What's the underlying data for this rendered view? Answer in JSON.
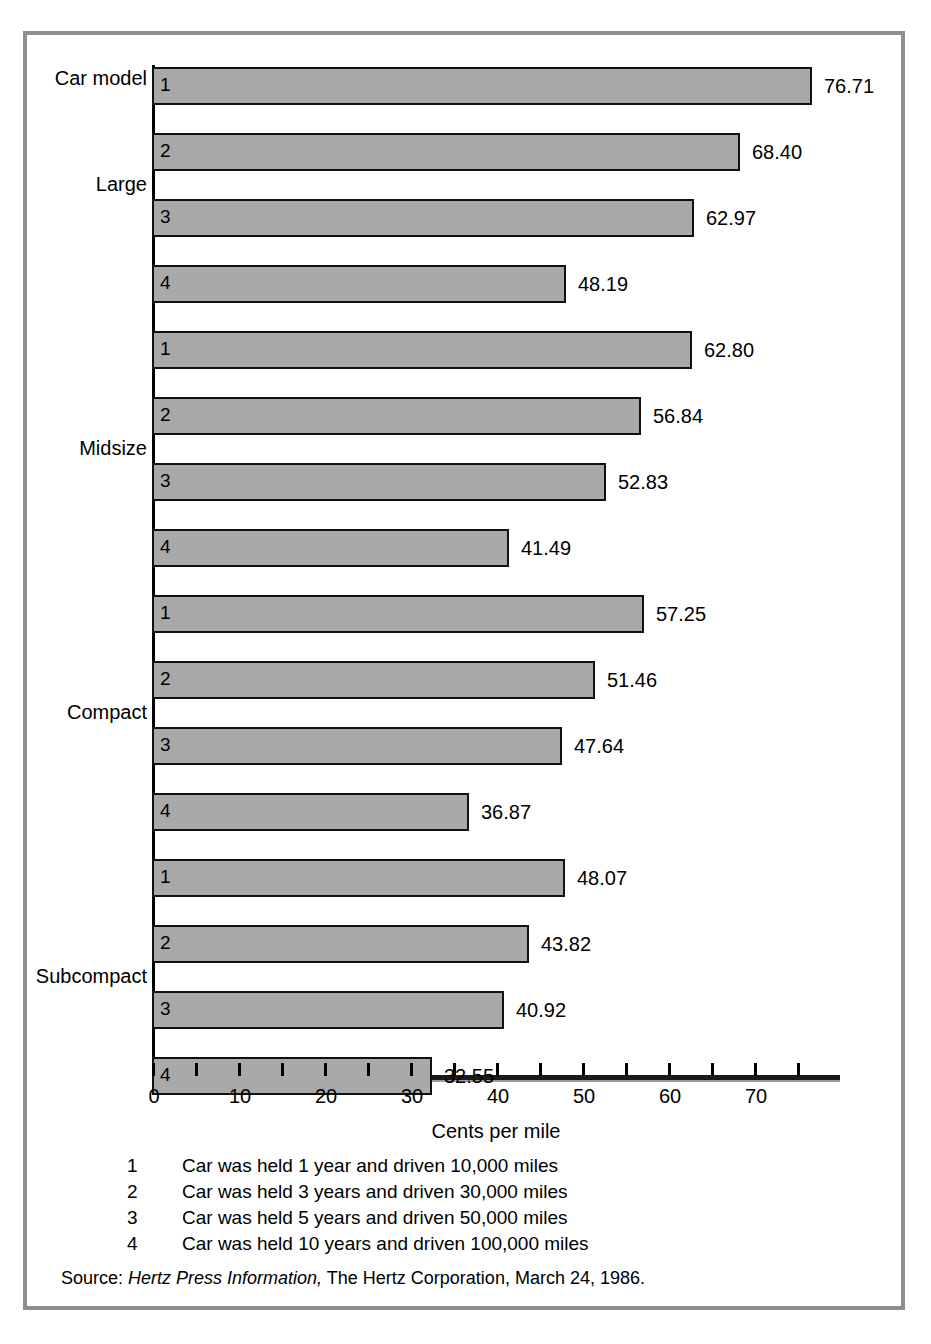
{
  "chart_data": {
    "type": "bar",
    "orientation": "horizontal",
    "title": "",
    "category_axis_title": "Car model",
    "xlabel": "Cents per mile",
    "ylabel": "",
    "xlim": [
      0,
      80
    ],
    "xticks": [
      0,
      5,
      10,
      15,
      20,
      25,
      30,
      35,
      40,
      45,
      50,
      55,
      60,
      65,
      70,
      75
    ],
    "xtick_labels": [
      "0",
      "",
      "10",
      "",
      "20",
      "",
      "30",
      "",
      "40",
      "",
      "50",
      "",
      "60",
      "",
      "70",
      ""
    ],
    "grid": false,
    "legend": "none",
    "groups": [
      {
        "name": "Large",
        "bars": [
          {
            "index": "1",
            "value": 76.71,
            "label": "76.71"
          },
          {
            "index": "2",
            "value": 68.4,
            "label": "68.40"
          },
          {
            "index": "3",
            "value": 62.97,
            "label": "62.97"
          },
          {
            "index": "4",
            "value": 48.19,
            "label": "48.19"
          }
        ]
      },
      {
        "name": "Midsize",
        "bars": [
          {
            "index": "1",
            "value": 62.8,
            "label": "62.80"
          },
          {
            "index": "2",
            "value": 56.84,
            "label": "56.84"
          },
          {
            "index": "3",
            "value": 52.83,
            "label": "52.83"
          },
          {
            "index": "4",
            "value": 41.49,
            "label": "41.49"
          }
        ]
      },
      {
        "name": "Compact",
        "bars": [
          {
            "index": "1",
            "value": 57.25,
            "label": "57.25"
          },
          {
            "index": "2",
            "value": 51.46,
            "label": "51.46"
          },
          {
            "index": "3",
            "value": 47.64,
            "label": "47.64"
          },
          {
            "index": "4",
            "value": 36.87,
            "label": "36.87"
          }
        ]
      },
      {
        "name": "Subcompact",
        "bars": [
          {
            "index": "1",
            "value": 48.07,
            "label": "48.07"
          },
          {
            "index": "2",
            "value": 43.82,
            "label": "43.82"
          },
          {
            "index": "3",
            "value": 40.92,
            "label": "40.92"
          },
          {
            "index": "4",
            "value": 32.55,
            "label": "32.55"
          }
        ]
      }
    ],
    "footnotes": [
      {
        "key": "1",
        "text": "Car was held 1 year and driven 10,000 miles"
      },
      {
        "key": "2",
        "text": "Car was held 3 years and driven 30,000 miles"
      },
      {
        "key": "3",
        "text": "Car was held 5 years and driven 50,000 miles"
      },
      {
        "key": "4",
        "text": "Car was held 10 years and driven 100,000 miles"
      }
    ],
    "source": {
      "label": "Source:",
      "title": "Hertz Press Information,",
      "rest": "The Hertz Corporation, March 24, 1986."
    },
    "colors": {
      "bar_fill": "#a9a9a9",
      "bar_stroke": "#111111",
      "axis": "#000000",
      "frame": "#8e8e8e",
      "text": "#000000",
      "background": "#ffffff"
    }
  }
}
